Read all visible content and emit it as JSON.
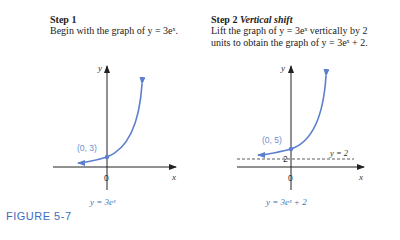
{
  "step1": {
    "title": "Step 1",
    "body": "Begin with the graph of y = 3eˣ.",
    "caption": "y = 3eˣ",
    "graph": {
      "y_axis_label": "y",
      "x_axis_label": "x",
      "origin_label": "0",
      "point_label": "(0, 3)"
    }
  },
  "step2": {
    "title": "Step 2",
    "subtitle": "Vertical shift",
    "body_line1": "Lift the graph of y = 3eˣ vertically by 2",
    "body_line2": "units to obtain the graph of y = 3eˣ + 2.",
    "caption": "y = 3eˣ + 2",
    "graph": {
      "y_axis_label": "y",
      "x_axis_label": "x",
      "origin_label": "0",
      "point_label": "(0, 5)",
      "asymptote_label": "y = 2",
      "asymptote_tick": "2"
    }
  },
  "figure_label": "FIGURE 5-7",
  "colors": {
    "curve": "#5b7fcc",
    "label_blue": "#3d6cc0"
  }
}
